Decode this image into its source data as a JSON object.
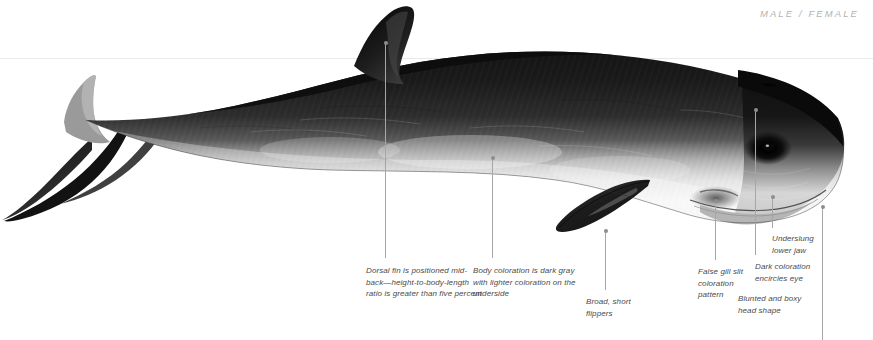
{
  "header": {
    "label": "MALE / FEMALE"
  },
  "illustration": {
    "subject": "whale-illustration",
    "style": "grayscale-scientific-illustration",
    "colors": {
      "dorsal_dark": "#1a1a1a",
      "mid_gray": "#6e6e6e",
      "ventral_light": "#e8e8e8",
      "outline": "#2b2b2b",
      "background": "#ffffff",
      "leader_line": "#a6a6a6",
      "caption_text": "#4a4a4a",
      "header_text": "#b2b2b2",
      "rule": "#e9e9e9"
    }
  },
  "annotations": [
    {
      "id": "dorsal-fin",
      "text": "Dorsal fin is positioned mid-back—height-to-body-length ratio is greater than five percent",
      "anchor_x": 385,
      "anchor_y": 43,
      "line_bottom": 258,
      "caption_x": 366,
      "caption_y": 265,
      "caption_width": 118
    },
    {
      "id": "body-coloration",
      "text": "Body coloration is dark gray with lighter coloration on the underside",
      "anchor_x": 492,
      "anchor_y": 158,
      "line_bottom": 258,
      "caption_x": 473,
      "caption_y": 265,
      "caption_width": 110
    },
    {
      "id": "flippers",
      "text": "Broad, short flippers",
      "anchor_x": 605,
      "anchor_y": 231,
      "line_bottom": 290,
      "caption_x": 586,
      "caption_y": 296,
      "caption_width": 90
    },
    {
      "id": "false-gill-slit",
      "text": "False gill slit coloration pattern",
      "anchor_x": 715,
      "anchor_y": 201,
      "line_bottom": 260,
      "caption_x": 698,
      "caption_y": 266,
      "caption_width": 60
    },
    {
      "id": "eye-coloration",
      "text": "Dark coloration encircles eye",
      "anchor_x": 755,
      "anchor_y": 110,
      "line_bottom": 255,
      "caption_x": 755,
      "caption_y": 261,
      "caption_width": 70
    },
    {
      "id": "underslung-jaw",
      "text": "Underslung lower jaw",
      "anchor_x": 772,
      "anchor_y": 197,
      "line_bottom": 228,
      "caption_x": 772,
      "caption_y": 233,
      "caption_width": 60
    },
    {
      "id": "head-shape",
      "text": "Blunted and boxy head shape",
      "anchor_x": 822,
      "anchor_y": 207,
      "line_bottom": 340,
      "caption_x": 738,
      "caption_y": 293,
      "caption_width": 82
    }
  ]
}
